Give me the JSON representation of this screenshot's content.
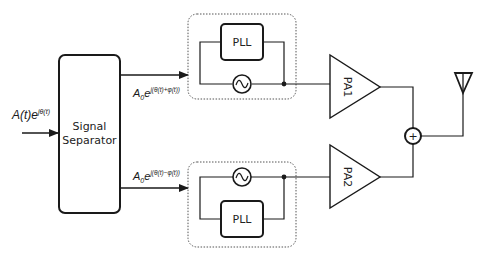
{
  "diagram": {
    "type": "block-diagram",
    "title": "",
    "input_signal": {
      "base": "A(t)e",
      "exponent": "jθ(t)"
    },
    "separator": {
      "line1": "Signal",
      "line2": "Separator"
    },
    "branch_top": {
      "signal_base": "A",
      "signal_sub": "0",
      "signal_e": "e",
      "signal_exponent": "j(θ(t)+φ(t))",
      "pll_label": "PLL",
      "oscillator_icon": "sine-wave",
      "amplifier_label": "PA1"
    },
    "branch_bottom": {
      "signal_base": "A",
      "signal_sub": "0",
      "signal_e": "e",
      "signal_exponent": "j(θ(t)−φ(t))",
      "pll_label": "PLL",
      "oscillator_icon": "sine-wave",
      "amplifier_label": "PA2"
    },
    "combiner": {
      "symbol": "+"
    },
    "output": {
      "icon": "antenna"
    },
    "colors": {
      "line": "#1a1a1a",
      "dotted_border": "#555555",
      "background": "#ffffff"
    }
  }
}
